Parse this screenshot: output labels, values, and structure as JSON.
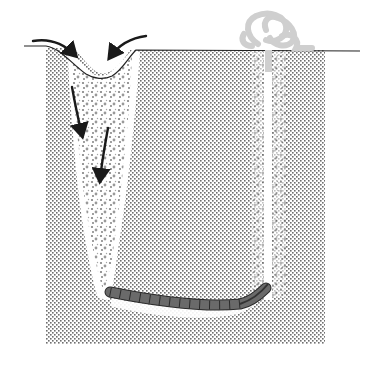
{
  "diagram": {
    "labels": [],
    "colors": {
      "background": "#ffffff",
      "sediment_dots": "#6e6e6e",
      "sediment_base": "#d9d9d9",
      "surface_line": "#222222",
      "arrows": "#1a1a1a",
      "organic_speckle": "#555555",
      "worm_body": "#6a6a6a",
      "worm_outline": "#2a2a2a",
      "casting": "#cfcfcf",
      "burrow_shaft": "#ffffff"
    },
    "elements": [
      {
        "name": "sediment-block",
        "x": 46,
        "y": 48,
        "width": 279,
        "height": 296
      },
      {
        "name": "feeding-funnel",
        "position": "left",
        "top_x": 95
      },
      {
        "name": "flow-arrows",
        "count": 4
      },
      {
        "name": "worm",
        "segments": 13
      },
      {
        "name": "tail-shaft",
        "x": 268
      },
      {
        "name": "fecal-casting",
        "position": "top-right"
      }
    ]
  }
}
